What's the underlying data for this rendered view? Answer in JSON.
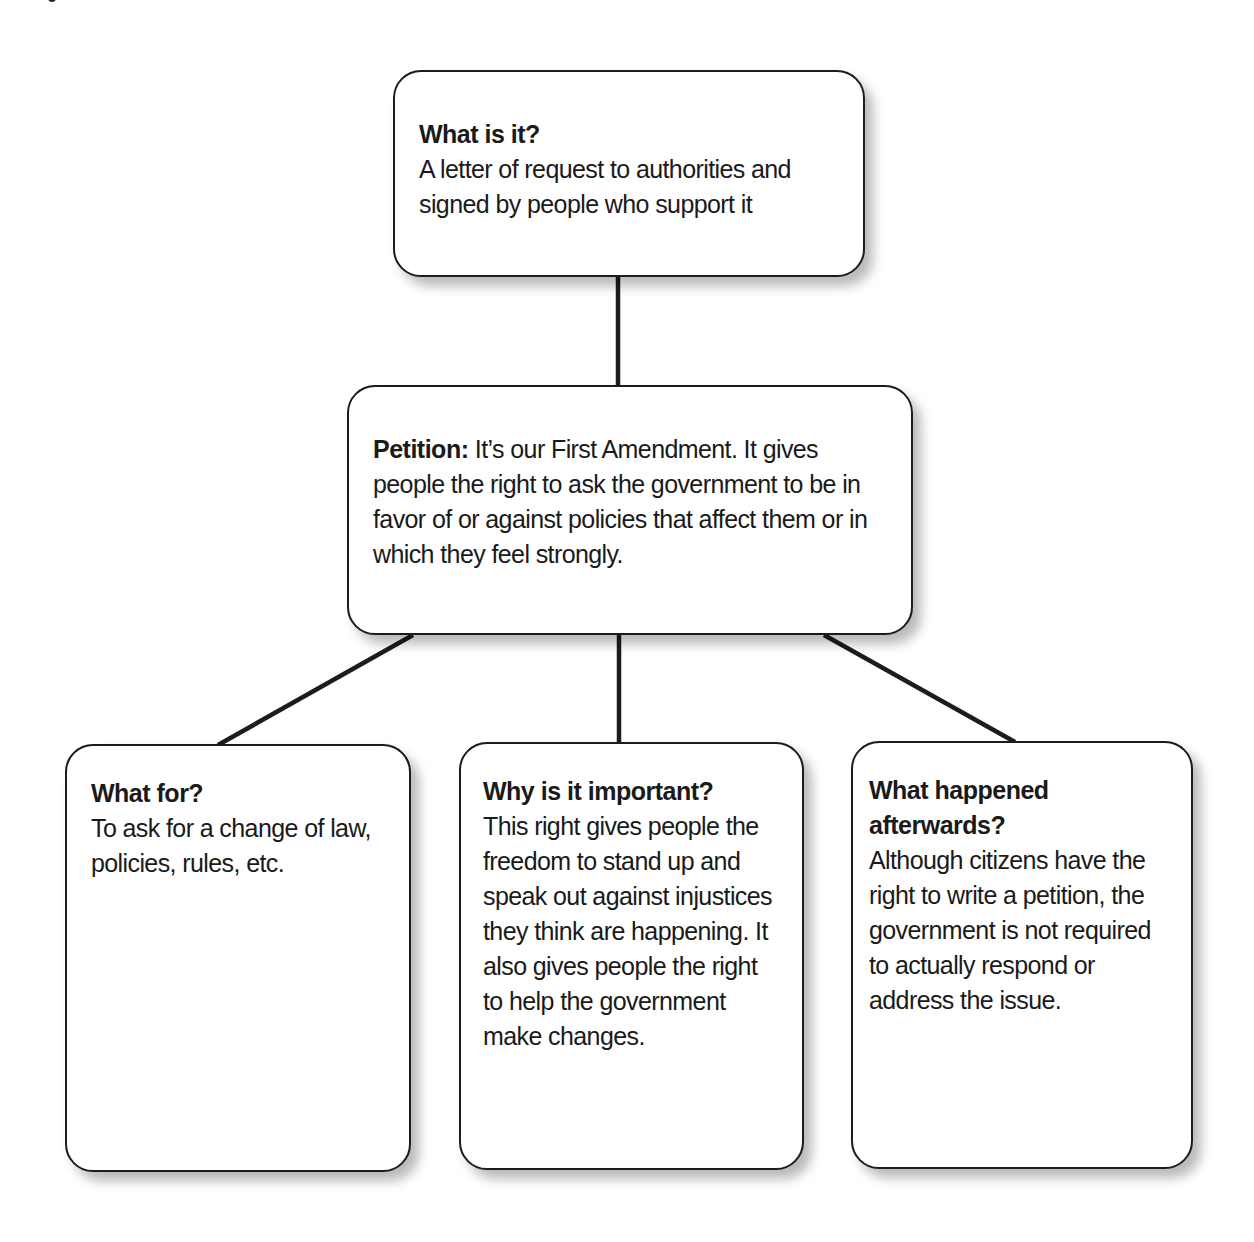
{
  "diagram": {
    "type": "concept-map",
    "colors": {
      "background": "#ffffff",
      "box_border": "#1c1c1c",
      "connector": "#1c1c1c",
      "text": "#1a1a1a"
    },
    "top_box": {
      "heading": "What is it?",
      "body": "A letter of request to authorities and signed by people who support it"
    },
    "center_box": {
      "heading": "Petition:",
      "body": " It’s our First Amendment.  It gives people the right to ask the government to be in favor of or against policies that affect them or in which they feel strongly."
    },
    "bottom_boxes": [
      {
        "heading": "What for?",
        "body": "To ask for a change of law, policies, rules, etc."
      },
      {
        "heading": "Why is it important?",
        "body": "This right gives people the freedom to stand up and speak out against injustices they think are happening.  It also gives people the right to help the government make changes."
      },
      {
        "heading": "What happened afterwards?",
        "body": "Although citizens have the right to write a petition, the government is not required to actually respond or address the issue."
      }
    ],
    "connections": [
      {
        "from": "top_box",
        "to": "center_box"
      },
      {
        "from": "center_box",
        "to": "bottom_boxes.0"
      },
      {
        "from": "center_box",
        "to": "bottom_boxes.1"
      },
      {
        "from": "center_box",
        "to": "bottom_boxes.2"
      }
    ]
  }
}
